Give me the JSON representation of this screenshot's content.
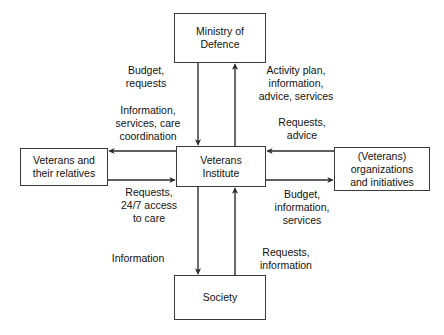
{
  "diagram": {
    "type": "block-flow-diagram",
    "line_color": "#2b2b2b",
    "box_border_color": "#3a3a3a",
    "background": "#ffffff",
    "nodes": {
      "ministry": {
        "label": "Ministry of\nDefence"
      },
      "institute": {
        "label": "Veterans\nInstitute"
      },
      "veterans": {
        "label": "Veterans and\ntheir relatives"
      },
      "organizations": {
        "label": "(Veterans)\norganizations\nand initiatives"
      },
      "society": {
        "label": "Society"
      }
    },
    "edge_labels": {
      "budget_requests": "Budget,\nrequests",
      "activity_plan": "Activity plan,\ninformation,\nadvice, services",
      "information_services_care": "Information,\nservices, care\ncoordination",
      "requests_advice": "Requests,\nadvice",
      "requests_247": "Requests,\n24/7 access\nto care",
      "budget_information_services": "Budget,\ninformation,\nservices",
      "information": "Information",
      "requests_information": "Requests,\ninformation"
    },
    "edges": [
      {
        "from": "ministry",
        "to": "institute",
        "label_key": "budget_requests",
        "direction": "down"
      },
      {
        "from": "institute",
        "to": "ministry",
        "label_key": "activity_plan",
        "direction": "up"
      },
      {
        "from": "institute",
        "to": "veterans",
        "label_key": "information_services_care",
        "direction": "left"
      },
      {
        "from": "veterans",
        "to": "institute",
        "label_key": "requests_247",
        "direction": "right"
      },
      {
        "from": "organizations",
        "to": "institute",
        "label_key": "requests_advice",
        "direction": "left"
      },
      {
        "from": "institute",
        "to": "organizations",
        "label_key": "budget_information_services",
        "direction": "right"
      },
      {
        "from": "institute",
        "to": "society",
        "label_key": "information",
        "direction": "down"
      },
      {
        "from": "society",
        "to": "institute",
        "label_key": "requests_information",
        "direction": "up"
      }
    ]
  }
}
